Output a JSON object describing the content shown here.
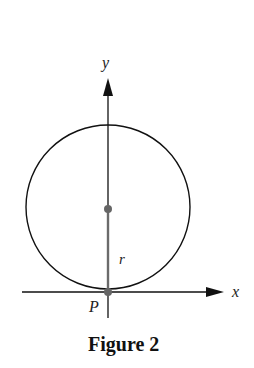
{
  "figure": {
    "caption": "Figure 2",
    "labels": {
      "y_axis": "y",
      "x_axis": "x",
      "radius": "r",
      "point": "P"
    },
    "colors": {
      "axis": "#111111",
      "circle": "#111111",
      "radius": "#6b6b6b",
      "point": "#666666"
    }
  }
}
